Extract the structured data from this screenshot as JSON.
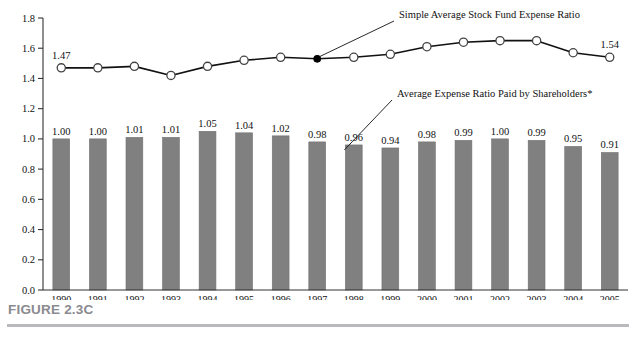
{
  "figure": {
    "caption": "FIGURE 2.3C"
  },
  "annotations": {
    "line_series_callout": "Simple Average Stock Fund Expense Ratio",
    "bar_series_callout": "Average Expense Ratio Paid by Shareholders*",
    "line_start_value_label": "1.47",
    "line_end_value_label": "1.54"
  },
  "colors": {
    "bar_fill": "#808080",
    "bar_edge": "#707070",
    "line_stroke": "#111111",
    "marker_fill": "#ffffff",
    "marker_edge": "#444444",
    "highlight_marker_fill": "#000000",
    "axis": "#333333",
    "caption_text": "#8a8a8f",
    "caption_rule": "#b9b9bd"
  },
  "chart_data": {
    "type": "bar",
    "title": "",
    "xlabel": "",
    "ylabel": "",
    "ylim": [
      0.0,
      1.8
    ],
    "ytick_step": 0.2,
    "grid": false,
    "legend_position": "inline-callouts",
    "categories": [
      "1990",
      "1991",
      "1992",
      "1993",
      "1994",
      "1995",
      "1996",
      "1997",
      "1998",
      "1999",
      "2000",
      "2001",
      "2002",
      "2003",
      "2004",
      "2005"
    ],
    "ytick_labels": [
      "0.0",
      "0.2",
      "0.4",
      "0.6",
      "0.8",
      "1.0",
      "1.2",
      "1.4",
      "1.6",
      "1.8"
    ],
    "series": [
      {
        "name": "Average Expense Ratio Paid by Shareholders*",
        "type": "bar",
        "values": [
          1.0,
          1.0,
          1.01,
          1.01,
          1.05,
          1.04,
          1.02,
          0.98,
          0.96,
          0.94,
          0.98,
          0.99,
          1.0,
          0.99,
          0.95,
          0.91
        ],
        "value_labels": [
          "1.00",
          "1.00",
          "1.01",
          "1.01",
          "1.05",
          "1.04",
          "1.02",
          "0.98",
          "0.96",
          "0.94",
          "0.98",
          "0.99",
          "1.00",
          "0.99",
          "0.95",
          "0.91"
        ]
      },
      {
        "name": "Simple Average Stock Fund Expense Ratio",
        "type": "line",
        "values": [
          1.47,
          1.47,
          1.48,
          1.42,
          1.48,
          1.52,
          1.54,
          1.53,
          1.54,
          1.56,
          1.61,
          1.64,
          1.65,
          1.65,
          1.57,
          1.54
        ],
        "labeled_points": {
          "1990": "1.47",
          "2005": "1.54"
        },
        "highlight_point_index": 7
      }
    ]
  }
}
